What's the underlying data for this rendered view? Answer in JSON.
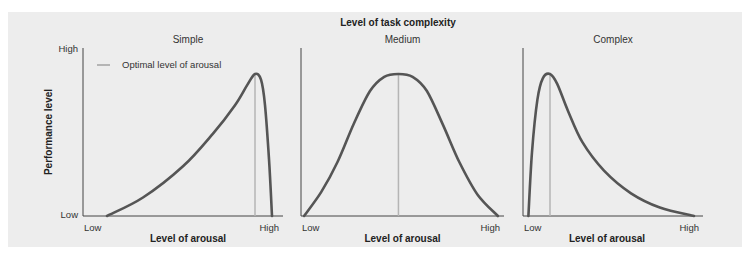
{
  "chart_data": {
    "type": "line",
    "title": "Level of task complexity",
    "ylabel": "Performance level",
    "ytick_labels": [
      "Low",
      "High"
    ],
    "legend": {
      "label": "Optimal level of arousal",
      "color": "#b5b5b5",
      "placement": "top-left"
    },
    "curve_color": "#555555",
    "axis_color": "#444444",
    "panels": [
      {
        "name": "Simple",
        "xlabel": "Level of arousal",
        "xtick_labels": [
          "Low",
          "High"
        ],
        "optimal_x": 0.86,
        "x": [
          0.12,
          0.3,
          0.5,
          0.65,
          0.76,
          0.82,
          0.86,
          0.89,
          0.91,
          0.93,
          0.945
        ],
        "y": [
          0.0,
          0.13,
          0.35,
          0.58,
          0.78,
          0.92,
          1.0,
          0.96,
          0.78,
          0.4,
          0.0
        ]
      },
      {
        "name": "Medium",
        "xlabel": "Level of arousal",
        "xtick_labels": [
          "Low",
          "High"
        ],
        "optimal_x": 0.48,
        "x": [
          0.015,
          0.1,
          0.18,
          0.26,
          0.34,
          0.41,
          0.48,
          0.55,
          0.62,
          0.7,
          0.78,
          0.87,
          0.97
        ],
        "y": [
          0.0,
          0.17,
          0.38,
          0.65,
          0.88,
          0.98,
          1.0,
          0.98,
          0.88,
          0.64,
          0.38,
          0.15,
          0.0
        ]
      },
      {
        "name": "Complex",
        "xlabel": "Level of arousal",
        "xtick_labels": [
          "Low",
          "High"
        ],
        "optimal_x": 0.15,
        "x": [
          0.03,
          0.05,
          0.08,
          0.11,
          0.15,
          0.19,
          0.25,
          0.33,
          0.45,
          0.6,
          0.76,
          0.95
        ],
        "y": [
          0.0,
          0.45,
          0.82,
          0.97,
          1.0,
          0.93,
          0.74,
          0.52,
          0.32,
          0.16,
          0.06,
          0.0
        ]
      }
    ]
  }
}
